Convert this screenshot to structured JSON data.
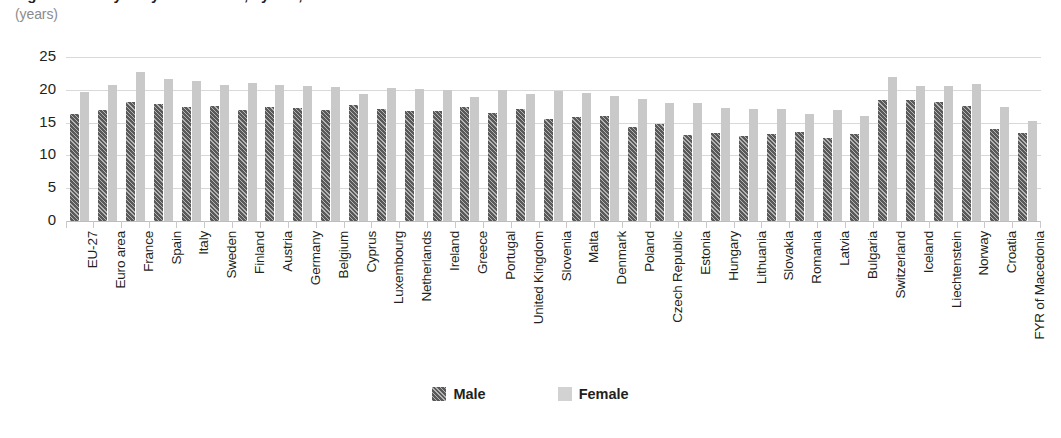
{
  "header": {
    "title": "Figure: Healthy life years at birth, by sex, 2011",
    "subtitle": "(years)"
  },
  "legend": {
    "position": "bottom-center",
    "items": [
      {
        "label": "Male",
        "swatch": "male-hatched-swatch",
        "color": "#595959"
      },
      {
        "label": "Female",
        "swatch": "female-solid-swatch",
        "color": "#c9c9c9"
      }
    ]
  },
  "chart_data": {
    "type": "bar",
    "title": "Figure: Healthy life years at birth, by sex, 2011",
    "subtitle": "(years)",
    "xlabel": "",
    "ylabel": "(years)",
    "ylim": [
      0,
      25
    ],
    "yticks": [
      0,
      5,
      10,
      15,
      20,
      25
    ],
    "ytick_labels": [
      "0",
      "5",
      "10",
      "15",
      "20",
      "25"
    ],
    "grid": true,
    "grid_axis": "y",
    "orientation": "vertical",
    "grouped": true,
    "categories": [
      "EU-27",
      "Euro area",
      "France",
      "Spain",
      "Italy",
      "Sweden",
      "Finland",
      "Austria",
      "Germany",
      "Belgium",
      "Cyprus",
      "Luxembourg",
      "Netherlands",
      "Ireland",
      "Greece",
      "Portugal",
      "United Kingdom",
      "Slovenia",
      "Malta",
      "Denmark",
      "Poland",
      "Czech Republic",
      "Estonia",
      "Hungary",
      "Lithuania",
      "Slovakia",
      "Romania",
      "Latvia",
      "Bulgaria",
      "Switzerland",
      "Iceland",
      "Liechtenstein",
      "Norway",
      "Croatia",
      "FYR of Macedonia"
    ],
    "series": [
      {
        "name": "Male",
        "color": "#595959",
        "pattern": "diagonal-hatch",
        "values": [
          16.3,
          16.9,
          18.1,
          17.8,
          17.4,
          17.6,
          16.9,
          17.4,
          17.2,
          16.9,
          17.7,
          17.0,
          16.7,
          16.8,
          17.4,
          16.4,
          17.0,
          15.6,
          15.9,
          16.0,
          14.4,
          14.8,
          13.1,
          13.4,
          12.9,
          13.3,
          13.5,
          12.7,
          13.2,
          18.4,
          18.5,
          18.2,
          17.5,
          14.1,
          13.4
        ]
      },
      {
        "name": "Female",
        "color": "#c9c9c9",
        "pattern": "solid",
        "values": [
          19.7,
          20.7,
          22.7,
          21.7,
          21.3,
          20.7,
          21.0,
          20.8,
          20.6,
          20.4,
          19.4,
          20.3,
          20.2,
          20.0,
          18.9,
          20.0,
          19.3,
          19.8,
          19.5,
          19.0,
          18.6,
          18.0,
          18.0,
          17.2,
          17.1,
          17.1,
          16.3,
          16.9,
          16.0,
          21.9,
          20.6,
          20.6,
          20.9,
          17.4,
          15.2
        ]
      }
    ]
  }
}
